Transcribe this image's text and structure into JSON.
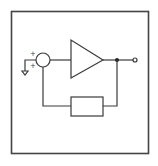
{
  "diagram": {
    "title": "",
    "type": "block-diagram",
    "colors": {
      "background": "#ffffff",
      "line": "#3a3a3a",
      "frame": "#444444"
    },
    "nodes": [
      {
        "id": "input-ground",
        "kind": "ground-symbol"
      },
      {
        "id": "summing-junction",
        "kind": "circle",
        "inputs_signs": [
          "+",
          "+"
        ]
      },
      {
        "id": "amplifier",
        "kind": "triangle"
      },
      {
        "id": "branch-node",
        "kind": "filled-dot"
      },
      {
        "id": "output-terminal",
        "kind": "open-circle"
      },
      {
        "id": "feedback-block",
        "kind": "rectangle"
      }
    ],
    "edges": [
      {
        "from": "input-ground",
        "to": "summing-junction"
      },
      {
        "from": "summing-junction",
        "to": "amplifier"
      },
      {
        "from": "amplifier",
        "to": "branch-node"
      },
      {
        "from": "branch-node",
        "to": "output-terminal"
      },
      {
        "from": "branch-node",
        "to": "feedback-block"
      },
      {
        "from": "feedback-block",
        "to": "summing-junction"
      }
    ],
    "labels": {
      "sign_top": "+",
      "sign_bottom": "+"
    }
  }
}
